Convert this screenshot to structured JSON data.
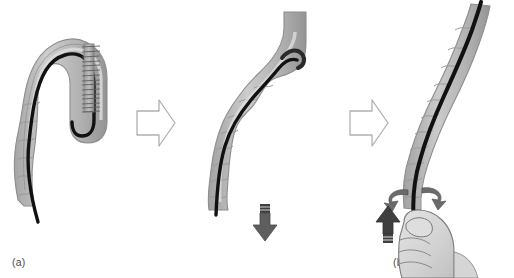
{
  "figure": {
    "panel_count": 3,
    "background_color": "#ffffff"
  },
  "colors": {
    "vessel_fill": "#b9b9b9",
    "vessel_fill_light": "#cfcfcf",
    "vessel_fill_dark": "#9a9a9a",
    "vessel_outline": "#8e8e8e",
    "guidewire": "#111111",
    "stent_body": "#8a8a8a",
    "stent_rib": "#5d5d5d",
    "solid_arrow": "#595959",
    "solid_arrow_dark": "#3f3f3f",
    "outline_arrow_stroke": "#b0b0b0",
    "outline_arrow_fill": "#ffffff",
    "hand_fill": "#d8d8d8",
    "hand_outline": "#7a7a7a",
    "caption_text": "#4a4a4a",
    "rotation_arrow": "#6b6b6b"
  },
  "panels": [
    {
      "id": "a",
      "caption": "(a)",
      "name": "panel-a-looped-catheter-with-stent",
      "description": "Catheter looped back on itself in a hairpin U-turn inside the duct, black guidewire running through the lumen, ribbed brush-like stent alongside the descending limb",
      "elements": {
        "vessel_label": "duct-wall",
        "guidewire_label": "guidewire",
        "stent_label": "ribbed-stent",
        "stent_rib_count": 15
      }
    },
    {
      "id": "b",
      "caption": "(b)",
      "name": "panel-b-catheter-pulled-down",
      "description": "Loop reduced, catheter and guidewire pulled downward through the duct; solid downward traction arrow below the duct outlet",
      "elements": {
        "vessel_label": "duct-wall",
        "guidewire_label": "guidewire",
        "arrow_label": "downward-traction-arrow",
        "arrow_direction": "down"
      }
    },
    {
      "id": "c",
      "caption": "(c)",
      "name": "panel-c-hand-advancing-catheter",
      "description": "Hand grips the straightened catheter at the duct outlet; solid upward arrow indicates advancement and paired curved arrows indicate rotation of the shaft",
      "elements": {
        "vessel_label": "duct-wall",
        "guidewire_label": "guidewire",
        "hand_label": "gripping-hand",
        "arrow_label": "upward-push-arrow",
        "arrow_direction": "up",
        "rotation_label": "rotation-arrows",
        "rotation_count": 2
      }
    }
  ],
  "step_arrows": [
    {
      "id": "step-1",
      "name": "step-arrow-a-to-b",
      "direction": "right",
      "style": "outline"
    },
    {
      "id": "step-2",
      "name": "step-arrow-b-to-c",
      "direction": "right",
      "style": "outline"
    }
  ]
}
